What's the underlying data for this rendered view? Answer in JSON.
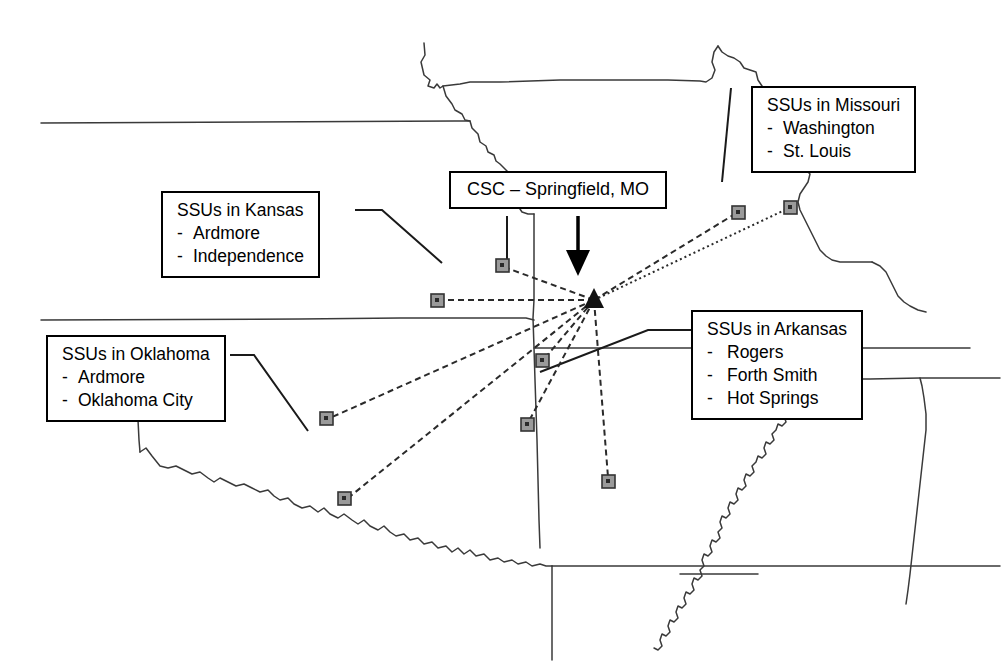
{
  "diagram": {
    "type": "hub-and-spoke-map",
    "region": "US Midwest / South Central states",
    "hub_marker": "filled-triangle",
    "spoke_marker": "gray-square",
    "line_style": "dashed",
    "colors": {
      "ink": "#000000",
      "map_outline": "#3a3a3a",
      "marker_fill": "#9a9a9a",
      "marker_border": "#333333"
    }
  },
  "callouts": {
    "csc": {
      "title": "CSC – Springfield, MO",
      "items": []
    },
    "missouri": {
      "title": "SSUs in Missouri",
      "items": [
        "Washington",
        "St. Louis"
      ]
    },
    "kansas": {
      "title": "SSUs in Kansas",
      "items": [
        "Ardmore",
        "Independence"
      ]
    },
    "oklahoma": {
      "title": "SSUs in Oklahoma",
      "items": [
        "Ardmore",
        "Oklahoma City"
      ]
    },
    "arkansas": {
      "title": "SSUs in Arkansas",
      "items": [
        "Rogers",
        "Forth Smith",
        "Hot Springs"
      ]
    }
  },
  "bullet": "-",
  "hub": {
    "label": "CSC – Springfield, MO",
    "x": 594,
    "y": 300
  },
  "sites": [
    {
      "name": "Independence",
      "state": "Kansas",
      "x": 502,
      "y": 265
    },
    {
      "name": "Ardmore",
      "state": "Kansas",
      "x": 437,
      "y": 300
    },
    {
      "name": "Oklahoma City",
      "state": "Oklahoma",
      "x": 326,
      "y": 418
    },
    {
      "name": "Ardmore",
      "state": "Oklahoma",
      "x": 344,
      "y": 498
    },
    {
      "name": "Rogers",
      "state": "Arkansas",
      "x": 542,
      "y": 360
    },
    {
      "name": "Forth Smith",
      "state": "Arkansas",
      "x": 527,
      "y": 424
    },
    {
      "name": "Hot Springs",
      "state": "Arkansas",
      "x": 608,
      "y": 481
    },
    {
      "name": "Washington",
      "state": "Missouri",
      "x": 738,
      "y": 212
    },
    {
      "name": "St. Louis",
      "state": "Missouri",
      "x": 790,
      "y": 207
    }
  ]
}
